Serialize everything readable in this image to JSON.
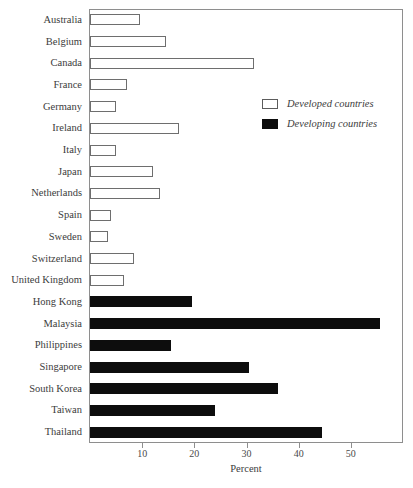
{
  "figure": {
    "title_sliver": "",
    "legend": {
      "position": "inside-upper-right",
      "entries": [
        {
          "label": "Developed countries",
          "swatch": "open-square-swatch",
          "color": "#ffffff"
        },
        {
          "label": "Developing countries",
          "swatch": "filled-square-swatch",
          "color": "#0d0d0d"
        }
      ]
    }
  },
  "chart_data": {
    "type": "bar",
    "orientation": "horizontal",
    "title": "",
    "xlabel": "Percent",
    "ylabel": "",
    "xlim": [
      0,
      60
    ],
    "xticks": [
      10,
      20,
      30,
      40,
      50
    ],
    "xticklabels": [
      "10",
      "20",
      "30",
      "40",
      "50"
    ],
    "grid": false,
    "legend_entries": [
      "Developed countries",
      "Developing countries"
    ],
    "categories": [
      "Australia",
      "Belgium",
      "Canada",
      "France",
      "Germany",
      "Ireland",
      "Italy",
      "Japan",
      "Netherlands",
      "Spain",
      "Sweden",
      "Switzerland",
      "United Kingdom",
      "Hong Kong",
      "Malaysia",
      "Philippines",
      "Singapore",
      "South Korea",
      "Taiwan",
      "Thailand"
    ],
    "values": [
      9.5,
      14.5,
      31.5,
      7.0,
      5.0,
      17.0,
      5.0,
      12.0,
      13.5,
      4.0,
      3.5,
      8.5,
      6.5,
      19.5,
      55.5,
      15.5,
      30.5,
      36.0,
      24.0,
      44.5
    ],
    "groups": [
      "Developed countries",
      "Developed countries",
      "Developed countries",
      "Developed countries",
      "Developed countries",
      "Developed countries",
      "Developed countries",
      "Developed countries",
      "Developed countries",
      "Developed countries",
      "Developed countries",
      "Developed countries",
      "Developed countries",
      "Developing countries",
      "Developing countries",
      "Developing countries",
      "Developing countries",
      "Developing countries",
      "Developing countries",
      "Developing countries"
    ]
  }
}
